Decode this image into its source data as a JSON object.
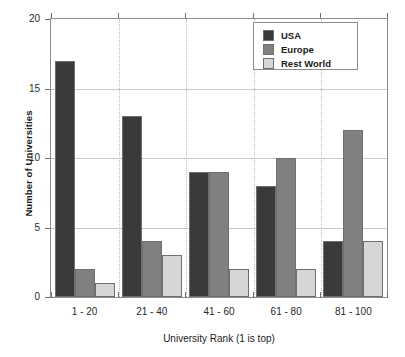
{
  "chart_data": {
    "type": "bar",
    "title": "",
    "xlabel": "University Rank (1 is top)",
    "ylabel": "Number of Universities",
    "categories": [
      "1 - 20",
      "21 - 40",
      "41 - 60",
      "61 - 80",
      "81 - 100"
    ],
    "series": [
      {
        "name": "USA",
        "color": "#3a3a3a",
        "values": [
          17,
          13,
          9,
          8,
          4
        ]
      },
      {
        "name": "Europe",
        "color": "#808080",
        "values": [
          2,
          4,
          9,
          10,
          12
        ]
      },
      {
        "name": "Rest World",
        "color": "#d6d6d6",
        "values": [
          1,
          3,
          2,
          2,
          4
        ]
      }
    ],
    "ylim": [
      0,
      20
    ],
    "yticks": [
      0,
      5,
      10,
      15,
      20
    ],
    "ytick_labels": [
      "0",
      "5",
      "10",
      "15",
      "20"
    ],
    "grid": "horizontal-and-vertical-dotted",
    "legend_position": "top-right",
    "legend_entries": [
      "USA",
      "Europe",
      "Rest World"
    ]
  },
  "colors": {
    "usa": "#3a3a3a",
    "europe": "#808080",
    "rest_world": "#d6d6d6",
    "axis": "#8c8c8c",
    "gridline": "#c9c9c9",
    "background": "#ffffff"
  }
}
